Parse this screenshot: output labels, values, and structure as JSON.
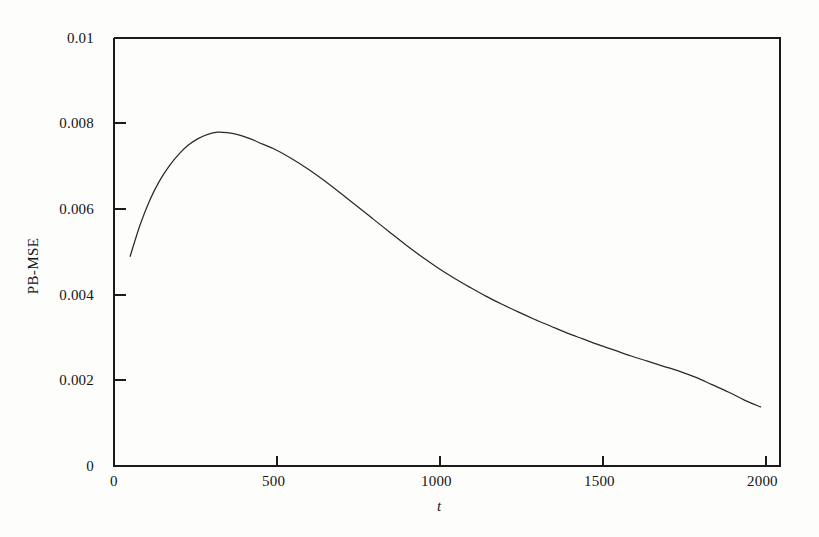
{
  "chart_data": {
    "type": "line",
    "title": "",
    "subtitle": "",
    "xlabel": "t",
    "ylabel": "PB-MSE",
    "xlim": [
      0,
      2060
    ],
    "ylim": [
      0,
      0.01
    ],
    "grid": false,
    "legend": null,
    "xticks": [
      0,
      500,
      1000,
      1500,
      2000
    ],
    "xtick_labels": [
      "0",
      "500",
      "1000",
      "1500",
      "2000"
    ],
    "yticks": [
      0,
      0.002,
      0.004,
      0.006,
      0.008,
      0.01
    ],
    "ytick_labels": [
      "0",
      "0.002",
      "0.004",
      "0.006",
      "0.008",
      "0.01"
    ],
    "line_color": "#2a2a2a",
    "axis_color": "#1b1b1b",
    "background_color": "#fdfdfc",
    "series": [
      {
        "name": "PB-MSE",
        "x": [
          50,
          80,
          110,
          140,
          170,
          200,
          230,
          260,
          290,
          320,
          350,
          380,
          420,
          460,
          500,
          550,
          600,
          650,
          700,
          750,
          800,
          850,
          900,
          950,
          1000,
          1050,
          1100,
          1150,
          1200,
          1250,
          1300,
          1350,
          1400,
          1450,
          1500,
          1550,
          1600,
          1650,
          1700,
          1750,
          1800,
          1850,
          1900,
          1950,
          2000
        ],
        "values": [
          0.0049,
          0.00562,
          0.0062,
          0.00665,
          0.007,
          0.00728,
          0.0075,
          0.00765,
          0.00775,
          0.0078,
          0.00779,
          0.00775,
          0.00765,
          0.00752,
          0.00739,
          0.00718,
          0.00694,
          0.00667,
          0.00638,
          0.00608,
          0.00578,
          0.00548,
          0.00518,
          0.0049,
          0.00464,
          0.0044,
          0.00418,
          0.00397,
          0.00378,
          0.0036,
          0.00343,
          0.00327,
          0.00311,
          0.00297,
          0.00283,
          0.0027,
          0.00257,
          0.00245,
          0.00233,
          0.00221,
          0.00207,
          0.0019,
          0.00173,
          0.00154,
          0.00138
        ]
      }
    ],
    "annotations": []
  },
  "axes": {
    "y_title": "PB-MSE",
    "x_title": "t",
    "x_tick_labels": [
      "0",
      "500",
      "1000",
      "1500",
      "2000"
    ],
    "y_tick_labels": [
      "0.01",
      "0.008",
      "0.006",
      "0.004",
      "0.002",
      "0"
    ]
  }
}
